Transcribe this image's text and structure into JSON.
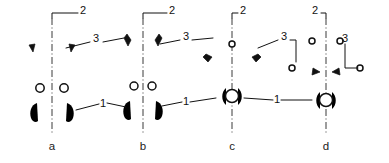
{
  "figure": {
    "background_color": "#ffffff",
    "line_color": "#111111",
    "centerline_color": "#3a3a3a",
    "width": 389,
    "height": 163
  },
  "subfigures": [
    {
      "id": "a",
      "label": "a",
      "label_x": 52,
      "label_y": 150,
      "center_x": 52,
      "description": "Wide splayed two-arm gripper with straight crossbar and hook jaws"
    },
    {
      "id": "b",
      "label": "b",
      "label_x": 143,
      "label_y": 150,
      "center_x": 143,
      "description": "Narrow near-vertical two-arm gripper with slender links and hook jaws"
    },
    {
      "id": "c",
      "label": "c",
      "label_x": 232,
      "label_y": 150,
      "center_x": 232,
      "description": "Wide spreading arms from single top pivot converging to central ball collet"
    },
    {
      "id": "d",
      "label": "d",
      "label_x": 326,
      "label_y": 150,
      "center_x": 326,
      "description": "Triangular four-bar linkage with pin joints and central ball collet"
    }
  ],
  "callouts": [
    {
      "numeral": "2",
      "x": 83,
      "y": 11,
      "target": "top shaft and collar",
      "subfigure": "a"
    },
    {
      "numeral": "2",
      "x": 172,
      "y": 11,
      "target": "top shaft and collar",
      "subfigure": "b"
    },
    {
      "numeral": "2",
      "x": 232,
      "y": 11,
      "target": "top shaft and collar",
      "subfigure": "c"
    },
    {
      "numeral": "2",
      "x": 315,
      "y": 11,
      "target": "top shaft and collar",
      "subfigure": "d"
    },
    {
      "numeral": "3",
      "x": 95,
      "y": 40,
      "target": "arm hatched joint region",
      "subfigure": "a"
    },
    {
      "numeral": "3",
      "x": 185,
      "y": 38,
      "target": "arm hatched joint region",
      "subfigure": "b"
    },
    {
      "numeral": "3",
      "x": 283,
      "y": 38,
      "target": "arm hatched joint region",
      "subfigure": "c"
    },
    {
      "numeral": "3",
      "x": 345,
      "y": 38,
      "target": "arm hatched joint region",
      "subfigure": "d"
    },
    {
      "numeral": "1",
      "x": 103,
      "y": 103,
      "target": "lower leg / jaw link",
      "subfigure": "a"
    },
    {
      "numeral": "1",
      "x": 186,
      "y": 101,
      "target": "lower leg / jaw link",
      "subfigure": "b"
    },
    {
      "numeral": "1",
      "x": 277,
      "y": 100,
      "target": "lower leg / jaw link",
      "subfigure": "c"
    },
    {
      "numeral": "1",
      "x": 305,
      "y": 100,
      "target": "lower leg / jaw link",
      "subfigure": "d"
    }
  ],
  "numerals": {
    "one": "1",
    "two": "2",
    "three": "3"
  }
}
